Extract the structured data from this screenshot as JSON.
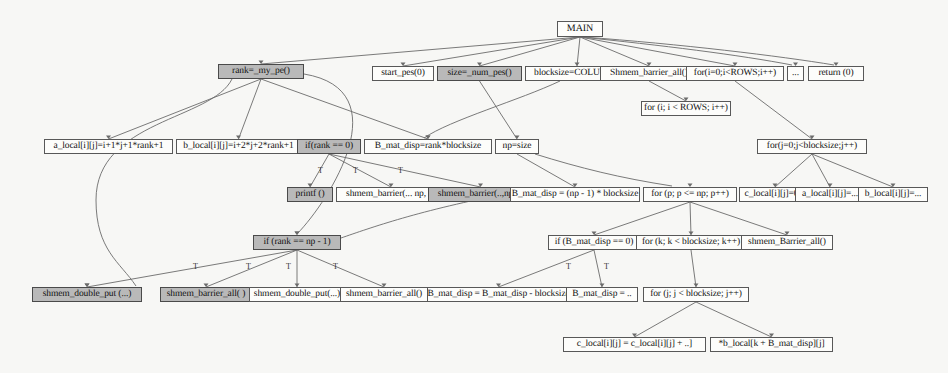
{
  "diagram": {
    "background_color": "#f7f7f5",
    "node_fill": "#fdfdfb",
    "node_shaded_fill": "#b9b9b9",
    "node_border": "#585858",
    "edge_color": "#6b6b6b"
  },
  "nodes": [
    {
      "id": "main",
      "label": "MAIN",
      "x": 557,
      "y": 21,
      "w": 46,
      "shaded": false
    },
    {
      "id": "rank_my_pe",
      "label": "rank=_my_pe()",
      "x": 218,
      "y": 64,
      "w": 86,
      "shaded": true
    },
    {
      "id": "start_pes",
      "label": "start_pes(0)",
      "x": 372,
      "y": 66,
      "w": 62,
      "shaded": false
    },
    {
      "id": "size_num_pes",
      "label": "size=_num_pes()",
      "x": 437,
      "y": 66,
      "w": 85,
      "shaded": true
    },
    {
      "id": "blocksize_cols",
      "label": "blocksize=COLUMNS",
      "x": 525,
      "y": 66,
      "w": 104,
      "shaded": false
    },
    {
      "id": "shmem_barrier_all_top",
      "label": "Shmem_barrier_all()",
      "x": 600,
      "y": 66,
      "w": 98,
      "shaded": false
    },
    {
      "id": "for_i_rows_top",
      "label": "for(i=0;i<ROWS;i++)",
      "x": 686,
      "y": 66,
      "w": 98,
      "shaded": false
    },
    {
      "id": "ellipsis_top",
      "label": "...",
      "x": 787,
      "y": 66,
      "w": 17,
      "shaded": false
    },
    {
      "id": "return0",
      "label": "return (0)",
      "x": 808,
      "y": 66,
      "w": 56,
      "shaded": false
    },
    {
      "id": "for_i_rows_mid",
      "label": "for (i; i < ROWS; i++)",
      "x": 641,
      "y": 101,
      "w": 90,
      "shaded": false
    },
    {
      "id": "a_local_init",
      "label": "a_local[i][j]=i+1*j+1*rank+1",
      "x": 44,
      "y": 139,
      "w": 129,
      "shaded": false
    },
    {
      "id": "b_local_init",
      "label": "b_local[i][j]=i+2*j+2*rank+1",
      "x": 176,
      "y": 139,
      "w": 125,
      "shaded": false
    },
    {
      "id": "if_rank_0",
      "label": "if(rank == 0)",
      "x": 297,
      "y": 139,
      "w": 64,
      "shaded": true
    },
    {
      "id": "b_mat_disp_rank",
      "label": "B_mat_disp=rank*blocksize",
      "x": 364,
      "y": 139,
      "w": 128,
      "shaded": false
    },
    {
      "id": "np_size",
      "label": "np=size",
      "x": 495,
      "y": 139,
      "w": 44,
      "shaded": false
    },
    {
      "id": "for_j_blocksize_top",
      "label": "for(j=0;j<blocksize;j++)",
      "x": 757,
      "y": 139,
      "w": 110,
      "shaded": false
    },
    {
      "id": "printf",
      "label": "printf ()",
      "x": 287,
      "y": 187,
      "w": 46,
      "shaded": true
    },
    {
      "id": "shmem_barrier_np1",
      "label": "shmem_barrier(... np, ..)",
      "x": 336,
      "y": 187,
      "w": 110,
      "shaded": false
    },
    {
      "id": "shmem_barrier_np2",
      "label": "shmem_barrier(..,np,..)",
      "x": 428,
      "y": 187,
      "w": 105,
      "shaded": true
    },
    {
      "id": "b_mat_disp_np1",
      "label": "B_mat_disp = (np - 1) * blocksize",
      "x": 510,
      "y": 187,
      "w": 130,
      "shaded": false
    },
    {
      "id": "for_p",
      "label": "for (p; p <= np; p++)",
      "x": 643,
      "y": 187,
      "w": 94,
      "shaded": false
    },
    {
      "id": "c_local_zero",
      "label": "c_local[i][j]=0.0",
      "x": 739,
      "y": 187,
      "w": 72,
      "shaded": false
    },
    {
      "id": "a_local_dots",
      "label": "a_local[i][j]=...",
      "x": 795,
      "y": 187,
      "w": 70,
      "shaded": false
    },
    {
      "id": "b_local_dots",
      "label": "b_local[i][j]=...",
      "x": 858,
      "y": 187,
      "w": 70,
      "shaded": false
    },
    {
      "id": "if_rank_np1",
      "label": "if (rank == np - 1)",
      "x": 253,
      "y": 235,
      "w": 88,
      "shaded": true
    },
    {
      "id": "if_bmat_zero",
      "label": "if (B_mat_disp == 0)",
      "x": 548,
      "y": 235,
      "w": 92,
      "shaded": false
    },
    {
      "id": "for_k",
      "label": "for (k; k < blocksize; k++)",
      "x": 636,
      "y": 235,
      "w": 110,
      "shaded": false
    },
    {
      "id": "shmem_barrier_all_mid",
      "label": "shmem_Barrier_all()",
      "x": 741,
      "y": 235,
      "w": 92,
      "shaded": false
    },
    {
      "id": "shmem_double_put_left",
      "label": "shmem_double_put (...)",
      "x": 32,
      "y": 287,
      "w": 110,
      "shaded": true
    },
    {
      "id": "shmem_barrier_all_b1",
      "label": "shmem_barrier_all( )",
      "x": 160,
      "y": 287,
      "w": 92,
      "shaded": true
    },
    {
      "id": "shmem_double_put_b2",
      "label": "shmem_double_put(...)",
      "x": 249,
      "y": 287,
      "w": 96,
      "shaded": false
    },
    {
      "id": "shmem_barrier_all_b3",
      "label": "shmem_barrier_all()",
      "x": 340,
      "y": 287,
      "w": 88,
      "shaded": false
    },
    {
      "id": "bmat_minus",
      "label": "B_mat_disp = B_mat_disp - blocksize",
      "x": 427,
      "y": 287,
      "w": 143,
      "shaded": false
    },
    {
      "id": "bmat_dots",
      "label": "B_mat_disp = ..",
      "x": 566,
      "y": 287,
      "w": 72,
      "shaded": false
    },
    {
      "id": "for_j_blocksize_bot",
      "label": "for (j; j < blocksize; j++)",
      "x": 643,
      "y": 287,
      "w": 106,
      "shaded": false
    },
    {
      "id": "c_local_accum",
      "label": "c_local[i][j] = c_local[i][j] + ..]",
      "x": 563,
      "y": 337,
      "w": 143,
      "shaded": false
    },
    {
      "id": "b_local_idx",
      "label": "*b_local[k + B_mat_disp][j]",
      "x": 710,
      "y": 337,
      "w": 123,
      "shaded": false
    }
  ],
  "edges": [
    {
      "from": "main",
      "to": "rank_my_pe"
    },
    {
      "from": "main",
      "to": "start_pes"
    },
    {
      "from": "main",
      "to": "size_num_pes"
    },
    {
      "from": "main",
      "to": "blocksize_cols"
    },
    {
      "from": "main",
      "to": "shmem_barrier_all_top"
    },
    {
      "from": "main",
      "to": "for_i_rows_top"
    },
    {
      "from": "main",
      "to": "ellipsis_top"
    },
    {
      "from": "main",
      "to": "return0"
    },
    {
      "from": "rank_my_pe",
      "to": "a_local_init"
    },
    {
      "from": "rank_my_pe",
      "to": "b_local_init"
    },
    {
      "from": "rank_my_pe",
      "to": "b_mat_disp_rank"
    },
    {
      "from": "rank_my_pe",
      "to": "if_rank_np1"
    },
    {
      "from": "rank_my_pe",
      "to": "shmem_double_put_left"
    },
    {
      "from": "size_num_pes",
      "to": "np_size"
    },
    {
      "from": "blocksize_cols",
      "to": "b_mat_disp_rank"
    },
    {
      "from": "shmem_barrier_all_top",
      "to": "for_i_rows_mid"
    },
    {
      "from": "for_i_rows_top",
      "to": "for_j_blocksize_top"
    },
    {
      "from": "for_j_blocksize_top",
      "to": "c_local_zero"
    },
    {
      "from": "for_j_blocksize_top",
      "to": "a_local_dots"
    },
    {
      "from": "for_j_blocksize_top",
      "to": "b_local_dots"
    },
    {
      "from": "if_rank_0",
      "to": "printf"
    },
    {
      "from": "if_rank_0",
      "to": "shmem_barrier_np1"
    },
    {
      "from": "if_rank_0",
      "to": "shmem_barrier_np2"
    },
    {
      "from": "np_size",
      "to": "b_mat_disp_np1"
    },
    {
      "from": "np_size",
      "to": "for_p"
    },
    {
      "from": "b_mat_disp_np1",
      "to": "if_rank_np1"
    },
    {
      "from": "for_p",
      "to": "if_bmat_zero"
    },
    {
      "from": "for_p",
      "to": "for_k"
    },
    {
      "from": "for_p",
      "to": "shmem_barrier_all_mid"
    },
    {
      "from": "if_rank_np1",
      "to": "shmem_double_put_left"
    },
    {
      "from": "if_rank_np1",
      "to": "shmem_barrier_all_b1"
    },
    {
      "from": "if_rank_np1",
      "to": "shmem_double_put_b2"
    },
    {
      "from": "if_rank_np1",
      "to": "shmem_barrier_all_b3"
    },
    {
      "from": "if_bmat_zero",
      "to": "bmat_minus"
    },
    {
      "from": "if_bmat_zero",
      "to": "bmat_dots"
    },
    {
      "from": "for_k",
      "to": "for_j_blocksize_bot"
    },
    {
      "from": "for_j_blocksize_bot",
      "to": "c_local_accum"
    },
    {
      "from": "for_j_blocksize_bot",
      "to": "b_local_idx"
    }
  ],
  "edge_labels": [
    {
      "text": "T",
      "x": 193,
      "y": 262
    },
    {
      "text": "T",
      "x": 246,
      "y": 262
    },
    {
      "text": "T",
      "x": 286,
      "y": 262
    },
    {
      "text": "T",
      "x": 333,
      "y": 262
    },
    {
      "text": "T",
      "x": 318,
      "y": 166
    },
    {
      "text": "T",
      "x": 353,
      "y": 166
    },
    {
      "text": "T",
      "x": 398,
      "y": 166
    },
    {
      "text": "T",
      "x": 566,
      "y": 262
    },
    {
      "text": "T",
      "x": 604,
      "y": 262
    }
  ]
}
